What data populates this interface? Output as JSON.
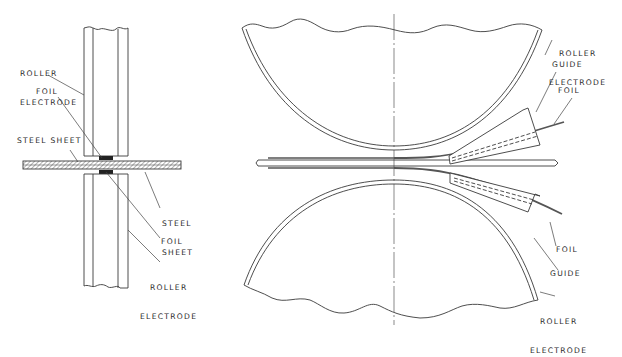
{
  "figure": {
    "left_view": {
      "labels": {
        "top_roller_electrode": [
          "ROLLER",
          "ELECTRODE"
        ],
        "top_foil": "FOIL",
        "steel_sheet_left": "STEEL SHEET",
        "steel_sheet_right": [
          "STEEL",
          "SHEET"
        ],
        "bottom_foil": "FOIL",
        "bottom_roller_electrode": [
          "ROLLER",
          "ELECTRODE"
        ]
      }
    },
    "right_view": {
      "labels": {
        "top_roller_electrode": [
          "ROLLER",
          "ELECTRODE"
        ],
        "top_guide": "GUIDE",
        "top_foil": "FOIL",
        "bottom_foil": "FOIL",
        "bottom_guide": "GUIDE",
        "bottom_roller_electrode": [
          "ROLLER",
          "ELECTRODE"
        ]
      }
    },
    "colors": {
      "line": "#3a3a3a",
      "foil": "#555555",
      "background": "#ffffff"
    }
  }
}
